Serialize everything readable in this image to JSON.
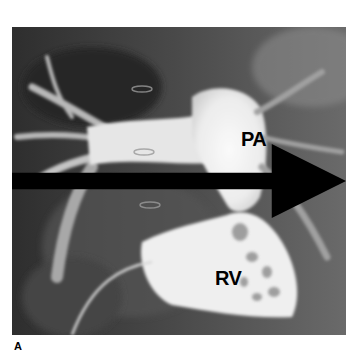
{
  "figure": {
    "labels": {
      "pulmonary_artery": "PA",
      "right_ventricle": "RV"
    },
    "annotation": "arrow-pointing-right",
    "panel_label": "A"
  }
}
